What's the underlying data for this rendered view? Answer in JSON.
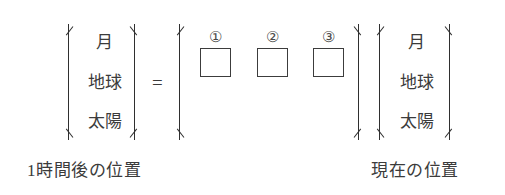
{
  "figure": {
    "equation": {
      "equals_symbol": "=",
      "left_matrix": {
        "label": "1時間後の位置",
        "rows": [
          "月",
          "地球",
          "太陽"
        ]
      },
      "operator_matrix": {
        "blanks": [
          {
            "marker": "①",
            "value": ""
          },
          {
            "marker": "②",
            "value": ""
          },
          {
            "marker": "③",
            "value": ""
          }
        ]
      },
      "right_matrix": {
        "label": "現在の位置",
        "rows": [
          "月",
          "地球",
          "太陽"
        ]
      }
    }
  }
}
